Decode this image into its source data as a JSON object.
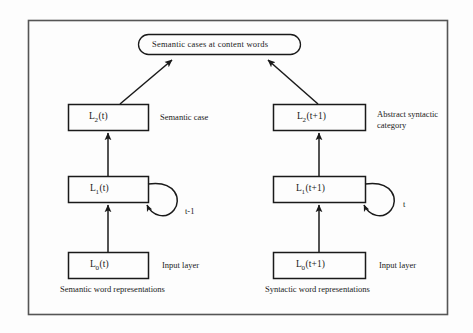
{
  "figure": {
    "type": "neural-network-architecture-diagram",
    "border_color": "#4a4a4a",
    "line_color": "#1a1a1a",
    "background": "#fdfdfd"
  },
  "output_node": {
    "shape": "rounded-rectangle",
    "text": "Semantic cases at content words"
  },
  "columns": [
    {
      "id": "semantic",
      "caption": "Semantic word representations",
      "layers": [
        {
          "id": "l2-left",
          "label_base": "L",
          "label_sub": "2",
          "label_arg": "(t)",
          "annotation": "Semantic case"
        },
        {
          "id": "l1-left",
          "label_base": "L",
          "label_sub": "1",
          "label_arg": "(t)",
          "recurrent_label": "t-1"
        },
        {
          "id": "l0-left",
          "label_base": "L",
          "label_sub": "0",
          "label_arg": "(t)",
          "annotation": "Input layer"
        }
      ]
    },
    {
      "id": "syntactic",
      "caption": "Syntactic word representations",
      "layers": [
        {
          "id": "l2-right",
          "label_base": "L",
          "label_sub": "2",
          "label_arg": "(t+1)",
          "annotation": "Abstract syntactic category"
        },
        {
          "id": "l1-right",
          "label_base": "L",
          "label_sub": "1",
          "label_arg": "(t+1)",
          "recurrent_label": "t"
        },
        {
          "id": "l0-right",
          "label_base": "L",
          "label_sub": "0",
          "label_arg": "(t+1)",
          "annotation": "Input layer"
        }
      ]
    }
  ]
}
